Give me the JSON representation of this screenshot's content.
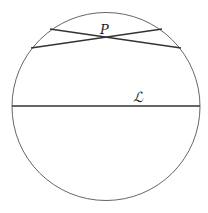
{
  "diagram": {
    "title": "",
    "circle": {
      "cx": 106,
      "cy": 106.5,
      "r": 94,
      "stroke": "#555555"
    },
    "lines": [
      {
        "name": "line-through-P-1",
        "x1": 50,
        "y1": 29,
        "x2": 181,
        "y2": 48
      },
      {
        "name": "line-through-P-2",
        "x1": 31,
        "y1": 48,
        "x2": 162,
        "y2": 29
      },
      {
        "name": "line-L",
        "x1": 12,
        "y1": 106,
        "x2": 200,
        "y2": 106
      }
    ],
    "labels": {
      "point": "P",
      "line": "ℒ"
    },
    "line_color": "#333333"
  }
}
